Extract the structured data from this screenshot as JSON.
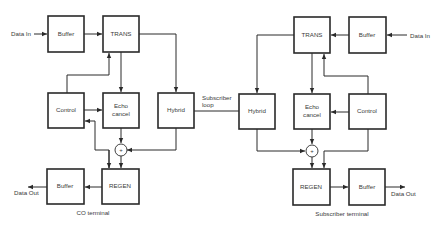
{
  "diagram": {
    "co_terminal": {
      "caption": "CO terminal",
      "data_in": "Data In",
      "data_out": "Data Out",
      "blocks": {
        "buffer_in": "Buffer",
        "trans": "TRANS",
        "control": "Control",
        "echo_cancel_line1": "Echo",
        "echo_cancel_line2": "cancel",
        "hybrid": "Hybrid",
        "regen": "REGEN",
        "buffer_out": "Buffer"
      },
      "summer": "+"
    },
    "link": {
      "line1": "Subscriber",
      "line2": "loop"
    },
    "subscriber_terminal": {
      "caption": "Subscriber terminal",
      "data_in": "Data In",
      "data_out": "Data Out",
      "blocks": {
        "buffer_in": "Buffer",
        "trans": "TRANS",
        "control": "Control",
        "echo_cancel_line1": "Echo",
        "echo_cancel_line2": "cancel",
        "hybrid": "Hybrid",
        "regen": "REGEN",
        "buffer_out": "Buffer"
      },
      "summer": "+"
    }
  }
}
